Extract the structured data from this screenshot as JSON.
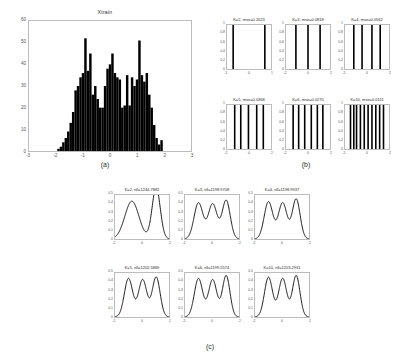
{
  "figure": {
    "captions": {
      "a": "(a)",
      "b": "(b)",
      "c": "(c)"
    }
  },
  "chart_data": [
    {
      "id": "histogram-xtrain",
      "type": "bar",
      "title": "Xtrain",
      "xlabel": "",
      "ylabel": "",
      "xlim": [
        -3,
        3
      ],
      "ylim": [
        0,
        60
      ],
      "xticks": [
        -3,
        -2,
        -1,
        0,
        1,
        2,
        3
      ],
      "yticks": [
        0,
        10,
        20,
        30,
        40,
        50,
        60
      ],
      "grid": false,
      "bin_width": 0.0909,
      "bin_centers": [
        -1.909,
        -1.818,
        -1.727,
        -1.636,
        -1.545,
        -1.455,
        -1.364,
        -1.273,
        -1.182,
        -1.091,
        -1.0,
        -0.909,
        -0.818,
        -0.727,
        -0.636,
        -0.545,
        -0.455,
        -0.364,
        -0.273,
        -0.182,
        -0.091,
        0.0,
        0.091,
        0.182,
        0.273,
        0.364,
        0.455,
        0.545,
        0.636,
        0.727,
        0.818,
        0.909,
        1.0,
        1.091,
        1.182,
        1.273,
        1.364,
        1.455,
        1.545,
        1.636,
        1.727,
        1.818,
        1.909
      ],
      "values": [
        1,
        2,
        4,
        6,
        9,
        13,
        18,
        28,
        30,
        34,
        36,
        52,
        37,
        45,
        26,
        30,
        24,
        20,
        20,
        30,
        38,
        40,
        45,
        36,
        34,
        33,
        20,
        21,
        35,
        21,
        34,
        30,
        33,
        51,
        35,
        32,
        36,
        26,
        20,
        12,
        6,
        3,
        5
      ],
      "bar_color": "#000000"
    },
    {
      "id": "kmeans-centroids",
      "type": "stem",
      "panel": "b",
      "subplots": [
        {
          "title": "K=2, mse=0.2023",
          "K": 2,
          "mse": 0.2023,
          "xlim": [
            -1,
            1
          ],
          "xticks": [
            -1,
            0,
            1
          ],
          "ylim": [
            0,
            1
          ],
          "yticks": [
            0,
            0.2,
            0.4,
            0.6,
            0.8,
            1
          ],
          "centers": [
            -0.72,
            0.72
          ]
        },
        {
          "title": "K=3, mse=0.0818",
          "K": 3,
          "mse": 0.0818,
          "xlim": [
            -2,
            2
          ],
          "xticks": [
            -2,
            0,
            2
          ],
          "ylim": [
            0,
            1
          ],
          "yticks": [
            0,
            0.2,
            0.4,
            0.6,
            0.8,
            1
          ],
          "centers": [
            -1.1,
            0.0,
            1.1
          ]
        },
        {
          "title": "K=4, mse=0.0562",
          "K": 4,
          "mse": 0.0562,
          "xlim": [
            -2,
            2
          ],
          "xticks": [
            -2,
            0,
            2
          ],
          "ylim": [
            0,
            1
          ],
          "yticks": [
            0,
            0.2,
            0.4,
            0.6,
            0.8,
            1
          ],
          "centers": [
            -1.2,
            -0.45,
            0.45,
            1.2
          ]
        },
        {
          "title": "K=5, mse=0.0368",
          "K": 5,
          "mse": 0.0368,
          "xlim": [
            -2,
            2
          ],
          "xticks": [
            -2,
            0,
            2
          ],
          "ylim": [
            0,
            1
          ],
          "yticks": [
            0,
            0.2,
            0.4,
            0.6,
            0.8,
            1
          ],
          "centers": [
            -1.3,
            -0.75,
            -0.05,
            0.7,
            1.3
          ]
        },
        {
          "title": "K=6, mse=0.0270",
          "K": 6,
          "mse": 0.027,
          "xlim": [
            -2,
            2
          ],
          "xticks": [
            -2,
            0,
            2
          ],
          "ylim": [
            0,
            1
          ],
          "yticks": [
            0,
            0.2,
            0.4,
            0.6,
            0.8,
            1
          ],
          "centers": [
            -1.35,
            -0.85,
            -0.3,
            0.3,
            0.85,
            1.35
          ]
        },
        {
          "title": "K=10, mse=0.0111",
          "K": 10,
          "mse": 0.0111,
          "xlim": [
            -2,
            2
          ],
          "xticks": [
            -2,
            0,
            2
          ],
          "ylim": [
            0,
            1
          ],
          "yticks": [
            0,
            0.2,
            0.4,
            0.6,
            0.8,
            1
          ],
          "centers": [
            -1.5,
            -1.2,
            -0.95,
            -0.6,
            -0.25,
            0.1,
            0.45,
            0.8,
            1.15,
            1.5
          ]
        }
      ]
    },
    {
      "id": "gmm-densities",
      "type": "line",
      "panel": "c",
      "subplots": [
        {
          "title": "K=2, nll=1244.7882",
          "K": 2,
          "nll": 1244.7882,
          "xlim": [
            -2,
            2
          ],
          "xticks": [
            -2,
            0,
            2
          ],
          "ylim": [
            0,
            0.5
          ],
          "yticks": [
            0,
            0.1,
            0.2,
            0.3,
            0.4,
            0.5
          ],
          "modes": [
            {
              "mu": -0.75,
              "sigma": 0.52,
              "w": 0.56
            },
            {
              "mu": 1.05,
              "sigma": 0.3,
              "w": 0.44
            }
          ]
        },
        {
          "title": "K=3, nll=1198.9708",
          "K": 3,
          "nll": 1198.9708,
          "xlim": [
            -2,
            2
          ],
          "xticks": [
            -2,
            0,
            2
          ],
          "ylim": [
            0,
            0.5
          ],
          "yticks": [
            0,
            0.1,
            0.2,
            0.3,
            0.4,
            0.5
          ],
          "modes": [
            {
              "mu": -1.0,
              "sigma": 0.33,
              "w": 0.34
            },
            {
              "mu": 0.05,
              "sigma": 0.33,
              "w": 0.33
            },
            {
              "mu": 1.05,
              "sigma": 0.3,
              "w": 0.33
            }
          ]
        },
        {
          "title": "K=4, nll=1198.9937",
          "K": 4,
          "nll": 1198.9937,
          "xlim": [
            -2,
            2
          ],
          "xticks": [
            -2,
            0,
            2
          ],
          "ylim": [
            0,
            0.5
          ],
          "yticks": [
            0,
            0.1,
            0.2,
            0.3,
            0.4,
            0.5
          ],
          "modes": [
            {
              "mu": -1.0,
              "sigma": 0.32,
              "w": 0.34
            },
            {
              "mu": 0.05,
              "sigma": 0.32,
              "w": 0.33
            },
            {
              "mu": 1.05,
              "sigma": 0.29,
              "w": 0.33
            }
          ]
        },
        {
          "title": "K=5, nll=1202.5869",
          "K": 5,
          "nll": 1202.5869,
          "xlim": [
            -2,
            2
          ],
          "xticks": [
            -2,
            0,
            2
          ],
          "ylim": [
            0,
            0.5
          ],
          "yticks": [
            0,
            0.1,
            0.2,
            0.3,
            0.4,
            0.5
          ],
          "modes": [
            {
              "mu": -1.0,
              "sigma": 0.31,
              "w": 0.34
            },
            {
              "mu": 0.05,
              "sigma": 0.31,
              "w": 0.33
            },
            {
              "mu": 1.05,
              "sigma": 0.29,
              "w": 0.33
            }
          ]
        },
        {
          "title": "K=6, nll=1199.5574",
          "K": 6,
          "nll": 1199.5574,
          "xlim": [
            -2,
            2
          ],
          "xticks": [
            -2,
            0,
            2
          ],
          "ylim": [
            0,
            0.5
          ],
          "yticks": [
            0,
            0.1,
            0.2,
            0.3,
            0.4,
            0.5
          ],
          "modes": [
            {
              "mu": -1.0,
              "sigma": 0.31,
              "w": 0.34
            },
            {
              "mu": 0.05,
              "sigma": 0.31,
              "w": 0.33
            },
            {
              "mu": 1.05,
              "sigma": 0.28,
              "w": 0.33
            }
          ]
        },
        {
          "title": "K=10, nll=1203.2931",
          "K": 10,
          "nll": 1203.2931,
          "xlim": [
            -2,
            2
          ],
          "xticks": [
            -2,
            0,
            2
          ],
          "ylim": [
            0,
            0.5
          ],
          "yticks": [
            0,
            0.1,
            0.2,
            0.3,
            0.4,
            0.5
          ],
          "modes": [
            {
              "mu": -1.0,
              "sigma": 0.3,
              "w": 0.34
            },
            {
              "mu": 0.05,
              "sigma": 0.3,
              "w": 0.33
            },
            {
              "mu": 1.05,
              "sigma": 0.28,
              "w": 0.33
            }
          ]
        }
      ]
    }
  ]
}
